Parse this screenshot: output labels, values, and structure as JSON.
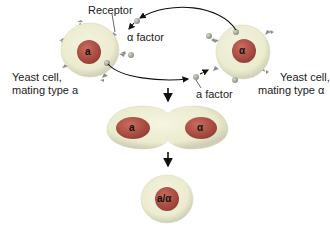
{
  "diagram": {
    "labels": {
      "receptor": "Receptor",
      "alpha_factor": "α factor",
      "a_factor": "a factor",
      "cell_a_line1": "Yeast cell,",
      "cell_a_line2": "mating type a",
      "cell_alpha_line1": "Yeast cell,",
      "cell_alpha_line2": "mating type α"
    },
    "nuclei": {
      "cell_a": "a",
      "cell_alpha": "α",
      "fusing_left": "a",
      "fusing_right": "α",
      "diploid": "a/α"
    },
    "colors": {
      "cytoplasm": "#ebebcf",
      "cytoplasm_edge": "#c8c8b0",
      "nucleus": "#a84a3f",
      "nucleus_light": "#c76a5e",
      "receptor": "#8a8f85",
      "factor": "#9a9e92",
      "arrow": "#111111"
    }
  }
}
